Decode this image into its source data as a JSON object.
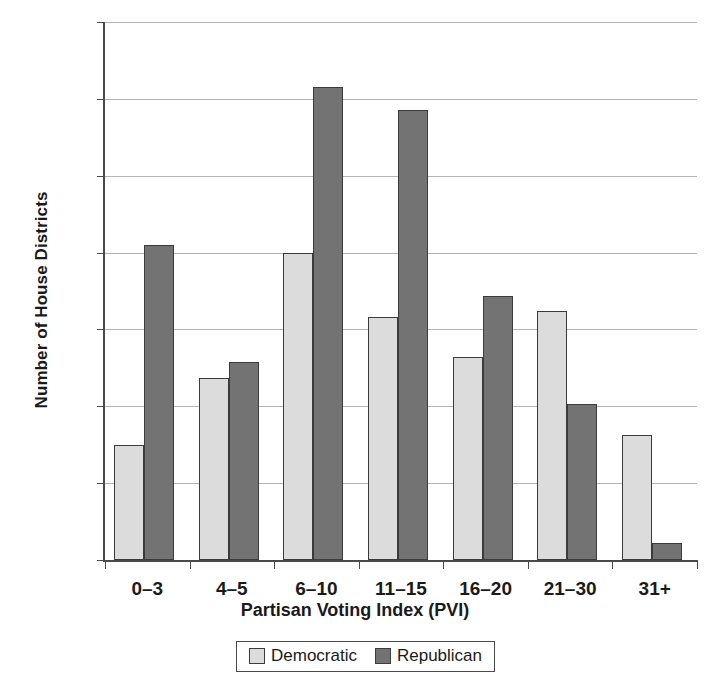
{
  "chart_data": {
    "type": "bar",
    "title": "",
    "xlabel": "Partisan Voting Index (PVI)",
    "ylabel": "Number of House Districts",
    "categories": [
      "0–3",
      "4–5",
      "6–10",
      "11–15",
      "16–20",
      "21–30",
      "31+"
    ],
    "series": [
      {
        "name": "Democratic",
        "color": "#dcdcdc",
        "values": [
          15,
          23.7,
          40,
          31.6,
          26.4,
          32.4,
          16.3
        ]
      },
      {
        "name": "Republican",
        "color": "#737373",
        "values": [
          41,
          25.8,
          61.5,
          58.5,
          34.4,
          20.3,
          2.2
        ]
      }
    ],
    "ylim": [
      0,
      70
    ],
    "yticks": [
      0,
      10,
      20,
      30,
      40,
      50,
      60,
      70
    ],
    "ytick_labels": [
      "0",
      "10",
      "20",
      "30",
      "40",
      "50",
      "60",
      "70"
    ],
    "grid": true,
    "legend_position": "bottom"
  },
  "legend": {
    "items": [
      {
        "label": "Democratic",
        "color": "#dcdcdc"
      },
      {
        "label": "Republican",
        "color": "#737373"
      }
    ]
  }
}
